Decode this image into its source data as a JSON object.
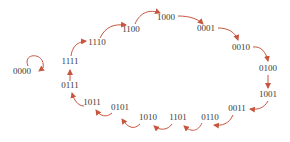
{
  "diagram": {
    "type": "state-sequence",
    "arrow_color": "#c8563e",
    "text_color": "#3a3a3a",
    "nodes": [
      {
        "id": "n0",
        "label": "0000",
        "x": 22,
        "y": 74
      },
      {
        "id": "n1",
        "label": "1111",
        "x": 70,
        "y": 64
      },
      {
        "id": "n2",
        "label": "1110",
        "x": 97,
        "y": 45
      },
      {
        "id": "n3",
        "label": "1100",
        "x": 131,
        "y": 32
      },
      {
        "id": "n4",
        "label": "1000",
        "x": 166,
        "y": 20
      },
      {
        "id": "n5",
        "label": "0001",
        "x": 206,
        "y": 31
      },
      {
        "id": "n6",
        "label": "0010",
        "x": 241,
        "y": 50
      },
      {
        "id": "n7",
        "label": "0100",
        "x": 268,
        "y": 71
      },
      {
        "id": "n8",
        "label": "1001",
        "x": 268,
        "y": 97
      },
      {
        "id": "n9",
        "label": "0011",
        "x": 237,
        "y": 111
      },
      {
        "id": "n10",
        "label": "0110",
        "x": 210,
        "y": 120
      },
      {
        "id": "n11",
        "label": "1101",
        "x": 178,
        "y": 120
      },
      {
        "id": "n12",
        "label": "1010",
        "x": 148,
        "y": 120
      },
      {
        "id": "n13",
        "label": "0101",
        "x": 120,
        "y": 110
      },
      {
        "id": "n14",
        "label": "1011",
        "x": 92,
        "y": 105
      },
      {
        "id": "n15",
        "label": "0111",
        "x": 70,
        "y": 88
      }
    ],
    "edges": [
      {
        "from": "0000",
        "to": "0000",
        "kind": "self-loop"
      },
      {
        "from": "1111",
        "to": "1110"
      },
      {
        "from": "1110",
        "to": "1100"
      },
      {
        "from": "1100",
        "to": "1000"
      },
      {
        "from": "1000",
        "to": "0001"
      },
      {
        "from": "0001",
        "to": "0010"
      },
      {
        "from": "0010",
        "to": "0100"
      },
      {
        "from": "0100",
        "to": "1001"
      },
      {
        "from": "1001",
        "to": "0011"
      },
      {
        "from": "0011",
        "to": "0110"
      },
      {
        "from": "0110",
        "to": "1101"
      },
      {
        "from": "1101",
        "to": "1010"
      },
      {
        "from": "1010",
        "to": "0101"
      },
      {
        "from": "0101",
        "to": "1011"
      },
      {
        "from": "1011",
        "to": "0111"
      },
      {
        "from": "0111",
        "to": "1111"
      }
    ]
  }
}
